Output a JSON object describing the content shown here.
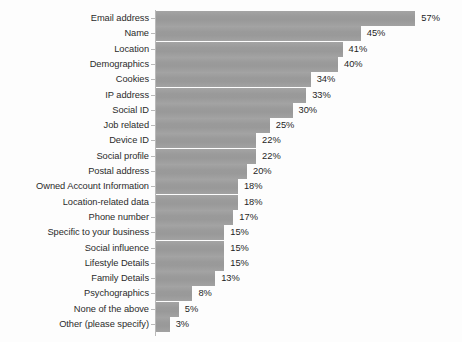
{
  "chart_data": {
    "type": "bar",
    "orientation": "horizontal",
    "title": "",
    "subtitle": "",
    "xlabel": "",
    "ylabel": "",
    "grid": false,
    "legend": null,
    "legend_position": "none",
    "axis_visible": true,
    "value_suffix": "%",
    "xlim": [
      0,
      57
    ],
    "bar_color": "#9b9b9b",
    "axis_color": "#b9b9b9",
    "label_color": "#2b2b2b",
    "value_color": "#1f1f1f",
    "background_color": "#fdfdfd",
    "categories": [
      "Email address",
      "Name",
      "Location",
      "Demographics",
      "Cookies",
      "IP address",
      "Social ID",
      "Job related",
      "Device ID",
      "Social profile",
      "Postal address",
      "Owned Account Information",
      "Location-related data",
      "Phone number",
      "Specific to your business",
      "Social influence",
      "Lifestyle Details",
      "Family Details",
      "Psychographics",
      "None of the above",
      "Other (please specify)"
    ],
    "values": [
      57,
      45,
      41,
      40,
      34,
      33,
      30,
      25,
      22,
      22,
      20,
      18,
      18,
      17,
      15,
      15,
      15,
      13,
      8,
      5,
      3
    ],
    "value_labels": [
      "57%",
      "45%",
      "41%",
      "40%",
      "34%",
      "33%",
      "30%",
      "25%",
      "22%",
      "22%",
      "20%",
      "18%",
      "18%",
      "17%",
      "15%",
      "15%",
      "15%",
      "13%",
      "8%",
      "5%",
      "3%"
    ]
  },
  "layout": {
    "bar_origin_x": 156,
    "axis_x": 155,
    "first_row_top": 11,
    "row_pitch": 15.3,
    "bar_height": 15,
    "px_per_percent": 4.55,
    "value_gap": 6
  }
}
